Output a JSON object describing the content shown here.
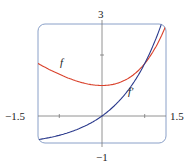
{
  "chart_data": {
    "type": "line",
    "title": "",
    "xlabel": "",
    "ylabel": "",
    "xlim": [
      -1.5,
      1.5
    ],
    "ylim": [
      -1,
      3
    ],
    "grid": false,
    "tick_labels": {
      "x_min": "−1.5",
      "x_max": "1.5",
      "y_max": "3",
      "y_min": "−1"
    },
    "series": [
      {
        "name": "f",
        "formula": "e^x - x",
        "color": "#d9412b",
        "x": [
          -1.5,
          -1,
          -0.5,
          0,
          0.5,
          1,
          1.3
        ],
        "values": [
          1.72,
          1.37,
          1.11,
          1.0,
          1.15,
          1.72,
          2.37
        ]
      },
      {
        "name": "f'",
        "formula": "e^x - 1",
        "color": "#2b3a8c",
        "x": [
          -1.5,
          -1,
          -0.5,
          0,
          0.5,
          1,
          1.35
        ],
        "values": [
          -0.78,
          -0.63,
          -0.39,
          0.0,
          0.65,
          1.72,
          2.86
        ]
      }
    ],
    "annotations": [
      {
        "text": "f",
        "near": "red curve"
      },
      {
        "text": "f′",
        "near": "blue curve"
      }
    ]
  },
  "labels": {
    "y_top": "3",
    "y_bottom": "−1",
    "x_left": "−1.5",
    "x_right": "1.5",
    "f": "f",
    "fprime": "f′"
  }
}
